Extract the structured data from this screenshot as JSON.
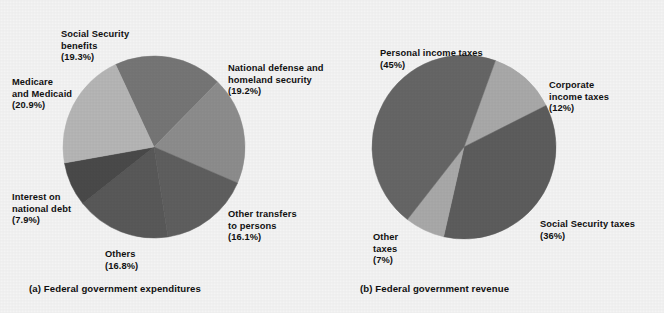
{
  "figure": {
    "background_color": "#f4f4f4",
    "width": 664,
    "height": 313
  },
  "panel_a": {
    "caption": "(a) Federal government expenditures",
    "labels": [
      {
        "name": "social-security-benefits",
        "title": "Social Security\nbenefits",
        "pct": "(19.3%)"
      },
      {
        "name": "national-defense",
        "title": "National defense and\nhomeland security",
        "pct": "(19.2%)"
      },
      {
        "name": "medicare-medicaid",
        "title": "Medicare\nand Medicaid",
        "pct": "(20.9%)"
      },
      {
        "name": "interest-national-debt",
        "title": "Interest on\nnational debt",
        "pct": "(7.9%)"
      },
      {
        "name": "others",
        "title": "Others",
        "pct": "(16.8%)"
      },
      {
        "name": "other-transfers",
        "title": "Other transfers\nto persons",
        "pct": "(16.1%)"
      }
    ]
  },
  "panel_b": {
    "caption": "(b) Federal government revenue",
    "labels": [
      {
        "name": "personal-income-taxes",
        "title": "Personal income taxes",
        "pct": "(45%)"
      },
      {
        "name": "corporate-income-taxes",
        "title": "Corporate\nincome taxes",
        "pct": "(12%)"
      },
      {
        "name": "social-security-taxes",
        "title": "Social Security taxes",
        "pct": "(36%)"
      },
      {
        "name": "other-taxes",
        "title": "Other\ntaxes",
        "pct": "(7%)"
      }
    ]
  },
  "chart_data": [
    {
      "type": "pie",
      "id": "federal-government-expenditures",
      "title": "(a) Federal government expenditures",
      "unit": "percent",
      "center": [
        154,
        147
      ],
      "radius": 91,
      "start_angle_deg": -25,
      "direction": "clockwise",
      "categories": [
        "Social Security benefits",
        "National defense and homeland security",
        "Other transfers to persons",
        "Others",
        "Interest on national debt",
        "Medicare and Medicaid"
      ],
      "values": [
        19.3,
        19.2,
        16.1,
        16.8,
        7.9,
        20.9
      ],
      "value_labels": [
        "(19.3%)",
        "(19.2%)",
        "(16.1%)",
        "(16.8%)",
        "(7.9%)",
        "(20.9%)"
      ],
      "colors": [
        "#767676",
        "#8d8d8d",
        "#5f5f5f",
        "#595959",
        "#4a4a4a",
        "#b6b6b6"
      ],
      "legend": "none",
      "grid": false
    },
    {
      "type": "pie",
      "id": "federal-government-revenue",
      "title": "(b) Federal government revenue",
      "unit": "percent",
      "center": [
        464,
        147
      ],
      "radius": 92,
      "start_angle_deg": 20,
      "direction": "clockwise",
      "categories": [
        "Corporate income taxes",
        "Social Security taxes",
        "Other taxes",
        "Personal income taxes"
      ],
      "values": [
        12,
        36,
        7,
        45
      ],
      "value_labels": [
        "(12%)",
        "(36%)",
        "(7%)",
        "(45%)"
      ],
      "colors": [
        "#a9a9a9",
        "#5d5d5d",
        "#a9a9a9",
        "#666666"
      ],
      "legend": "none",
      "grid": false
    }
  ]
}
